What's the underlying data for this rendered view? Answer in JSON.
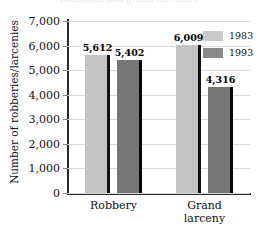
{
  "chart_data": {
    "type": "bar",
    "title": "",
    "xlabel": "",
    "ylabel": "Number of robberies/larcenies",
    "categories": [
      "Robbery",
      "Grand larceny"
    ],
    "category_lines": [
      [
        "Robbery"
      ],
      [
        "Grand",
        "larceny"
      ]
    ],
    "series": [
      {
        "name": "1983",
        "values": [
          5612,
          6009
        ],
        "labels": [
          "5,612",
          "6,009"
        ],
        "color": "#c3c3c3"
      },
      {
        "name": "1993",
        "values": [
          5402,
          4316
        ],
        "labels": [
          "5,402",
          "4,316"
        ],
        "color": "#767676"
      }
    ],
    "ylim": [
      0,
      7000
    ],
    "yticks": [
      0,
      1000,
      2000,
      3000,
      4000,
      5000,
      6000,
      7000
    ],
    "ytick_labels": [
      "0",
      "1,000",
      "2,000",
      "3,000",
      "4,000",
      "5,000",
      "6,000",
      "7,000"
    ],
    "grid": true,
    "legend_position": "top-right"
  },
  "legend": {
    "items": [
      {
        "label": "1983",
        "color": "#c9c9c9"
      },
      {
        "label": "1993",
        "color": "#8a8a8a"
      }
    ]
  },
  "title_sliver": {
    "text": "robberies and grand larcenies"
  }
}
